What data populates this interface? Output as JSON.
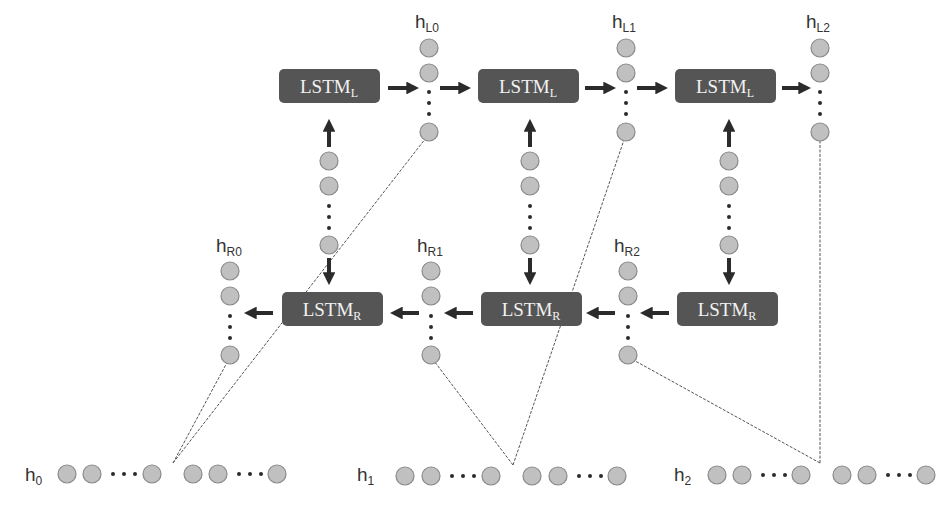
{
  "diagram": {
    "colors": {
      "box_fill": "#555555",
      "box_text": "#f2f2f2",
      "node_fill": "#c0c0c0",
      "node_stroke": "#8a8a8a",
      "arrow": "#2b2b2b",
      "dashed_line": "#555555",
      "label": "#333333"
    },
    "lstm_left": [
      {
        "id": "lstm-l-0",
        "label": "LSTM",
        "sub": "L"
      },
      {
        "id": "lstm-l-1",
        "label": "LSTM",
        "sub": "L"
      },
      {
        "id": "lstm-l-2",
        "label": "LSTM",
        "sub": "L"
      }
    ],
    "lstm_right": [
      {
        "id": "lstm-r-0",
        "label": "LSTM",
        "sub": "R"
      },
      {
        "id": "lstm-r-1",
        "label": "LSTM",
        "sub": "R"
      },
      {
        "id": "lstm-r-2",
        "label": "LSTM",
        "sub": "R"
      }
    ],
    "left_outputs": [
      {
        "label": "h",
        "sub": "L0"
      },
      {
        "label": "h",
        "sub": "L1"
      },
      {
        "label": "h",
        "sub": "L2"
      }
    ],
    "right_outputs": [
      {
        "label": "h",
        "sub": "R0"
      },
      {
        "label": "h",
        "sub": "R1"
      },
      {
        "label": "h",
        "sub": "R2"
      }
    ],
    "inputs": [
      {
        "label": "h",
        "sub": "0"
      },
      {
        "label": "h",
        "sub": "1"
      },
      {
        "label": "h",
        "sub": "2"
      }
    ],
    "ellipsis": "..."
  }
}
